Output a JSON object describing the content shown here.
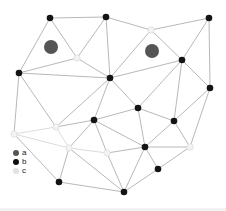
{
  "figure": {
    "width": 226,
    "height": 211,
    "background": "#ffffff"
  },
  "graph": {
    "colors": {
      "edge": "#a6a6a6",
      "edge_light": "#d2d2d2",
      "node_b": "#141414",
      "node_c_fill": "#f3f3f3",
      "node_c_stroke": "#dadada",
      "marker_a": "#555555"
    },
    "edge_width": 0.8,
    "node_radius_b": 3.3,
    "node_radius_c": 3.2,
    "marker_radius_a": 7,
    "nodes": [
      {
        "id": "A",
        "type": "b",
        "x": 50,
        "y": 18
      },
      {
        "id": "B",
        "type": "b",
        "x": 106,
        "y": 17
      },
      {
        "id": "C",
        "type": "b",
        "x": 209,
        "y": 18
      },
      {
        "id": "D",
        "type": "b",
        "x": 19,
        "y": 73
      },
      {
        "id": "E",
        "type": "b",
        "x": 110,
        "y": 78
      },
      {
        "id": "F",
        "type": "b",
        "x": 182,
        "y": 60
      },
      {
        "id": "G",
        "type": "b",
        "x": 210,
        "y": 88
      },
      {
        "id": "H",
        "type": "b",
        "x": 94,
        "y": 120
      },
      {
        "id": "I",
        "type": "b",
        "x": 138,
        "y": 108
      },
      {
        "id": "J",
        "type": "b",
        "x": 174,
        "y": 121
      },
      {
        "id": "K",
        "type": "b",
        "x": 145,
        "y": 147
      },
      {
        "id": "L",
        "type": "b",
        "x": 158,
        "y": 169
      },
      {
        "id": "M",
        "type": "b",
        "x": 124,
        "y": 192
      },
      {
        "id": "N",
        "type": "b",
        "x": 59,
        "y": 182
      },
      {
        "id": "c1",
        "type": "c",
        "x": 77,
        "y": 58
      },
      {
        "id": "c2",
        "type": "c",
        "x": 151,
        "y": 30
      },
      {
        "id": "c3",
        "type": "c",
        "x": 14,
        "y": 134
      },
      {
        "id": "c4",
        "type": "c",
        "x": 56,
        "y": 127
      },
      {
        "id": "c5",
        "type": "c",
        "x": 69,
        "y": 148
      },
      {
        "id": "c6",
        "type": "c",
        "x": 107,
        "y": 153
      },
      {
        "id": "c7",
        "type": "c",
        "x": 190,
        "y": 147
      }
    ],
    "markers": [
      {
        "id": "a1",
        "type": "a",
        "x": 51,
        "y": 47
      },
      {
        "id": "a2",
        "type": "a",
        "x": 152,
        "y": 51
      }
    ],
    "edges": [
      [
        "A",
        "B"
      ],
      [
        "B",
        "c2"
      ],
      [
        "c2",
        "C"
      ],
      [
        "C",
        "G"
      ],
      [
        "G",
        "c7"
      ],
      [
        "c7",
        "L"
      ],
      [
        "L",
        "M"
      ],
      [
        "M",
        "N"
      ],
      [
        "N",
        "c3"
      ],
      [
        "c3",
        "D"
      ],
      [
        "D",
        "A"
      ],
      [
        "A",
        "c1"
      ],
      [
        "B",
        "c1"
      ],
      [
        "c1",
        "D"
      ],
      [
        "c1",
        "E"
      ],
      [
        "B",
        "E"
      ],
      [
        "E",
        "c2"
      ],
      [
        "D",
        "E"
      ],
      [
        "D",
        "c4"
      ],
      [
        "c4",
        "c3"
      ],
      [
        "c4",
        "c5"
      ],
      [
        "c3",
        "c5"
      ],
      [
        "c5",
        "N"
      ],
      [
        "c4",
        "E"
      ],
      [
        "c4",
        "H"
      ],
      [
        "c5",
        "H"
      ],
      [
        "c5",
        "c6"
      ],
      [
        "c5",
        "M"
      ],
      [
        "c6",
        "M"
      ],
      [
        "c6",
        "H"
      ],
      [
        "c6",
        "K"
      ],
      [
        "K",
        "M"
      ],
      [
        "K",
        "L"
      ],
      [
        "K",
        "c7"
      ],
      [
        "J",
        "c7"
      ],
      [
        "G",
        "J"
      ],
      [
        "F",
        "G"
      ],
      [
        "C",
        "F"
      ],
      [
        "F",
        "J"
      ],
      [
        "F",
        "I"
      ],
      [
        "I",
        "J"
      ],
      [
        "I",
        "K"
      ],
      [
        "J",
        "K"
      ],
      [
        "E",
        "F"
      ],
      [
        "E",
        "I"
      ],
      [
        "E",
        "H"
      ],
      [
        "H",
        "I"
      ],
      [
        "H",
        "K"
      ],
      [
        "c2",
        "F"
      ]
    ]
  },
  "legend": {
    "items": [
      {
        "label": "a",
        "color": "#555555",
        "dot": 6
      },
      {
        "label": "b",
        "color": "#0f0f0f",
        "dot": 6
      },
      {
        "label": "c",
        "color": "#e2e2e2",
        "dot": 6
      }
    ]
  }
}
